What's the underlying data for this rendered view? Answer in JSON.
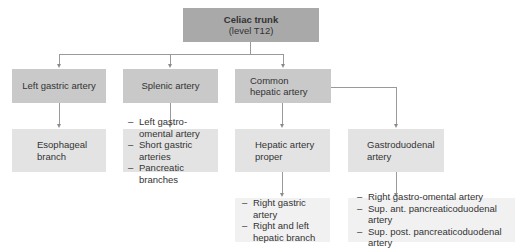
{
  "root": {
    "title": "Celiac trunk",
    "subtitle": "(level T12)"
  },
  "level2": {
    "left_gastric": "Left gastric artery",
    "splenic": "Splenic artery",
    "common_hepatic": "Common hepatic artery"
  },
  "level3": {
    "esophageal": "Esophageal branch",
    "splenic_branches": [
      "Left gastro-omental artery",
      "Short gastric arteries",
      "Pancreatic branches"
    ],
    "hepatic_proper": "Hepatic artery proper",
    "gastroduodenal": "Gastroduodenal artery"
  },
  "level4": {
    "hepatic_proper_branches": [
      "Right gastric artery",
      "Right and left hepatic branch"
    ],
    "gastroduodenal_branches": [
      "Right gastro-omental artery",
      "Sup. ant. pancreaticoduodenal artery",
      "Sup. post. pancreaticoduodenal artery"
    ]
  },
  "colors": {
    "root": "#a9a9a9",
    "level2": "#c9c9c9",
    "level3": "#e3e3e3",
    "level4": "#f1f1f1",
    "connector": "#9a9a9a"
  }
}
